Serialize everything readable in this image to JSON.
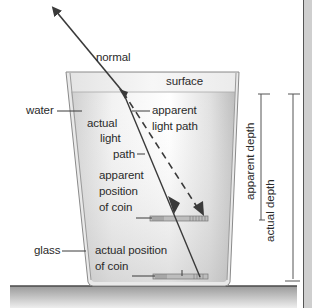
{
  "diagram": {
    "labels": {
      "normal": "normal",
      "surface": "surface",
      "water": "water",
      "actual_light_path_1": "actual",
      "actual_light_path_2": "light",
      "actual_light_path_3": "path",
      "apparent_light_path_1": "apparent",
      "apparent_light_path_2": "light path",
      "apparent_position_1": "apparent",
      "apparent_position_2": "position",
      "apparent_position_3": "of coin",
      "glass": "glass",
      "actual_position_1": "actual position",
      "actual_position_2": "of coin",
      "apparent_depth": "apparent depth",
      "actual_depth": "actual depth"
    },
    "colors": {
      "line": "#3a3a3a",
      "glass_edge": "#9a9a9a",
      "water_light": "#f4f4f4",
      "water_dark": "#c9c9c9",
      "table_top": "#5a5a5a",
      "table_light": "#e6e6e6",
      "table_dark": "#9c9c9c",
      "right_strip": "#cfcfcf"
    }
  }
}
